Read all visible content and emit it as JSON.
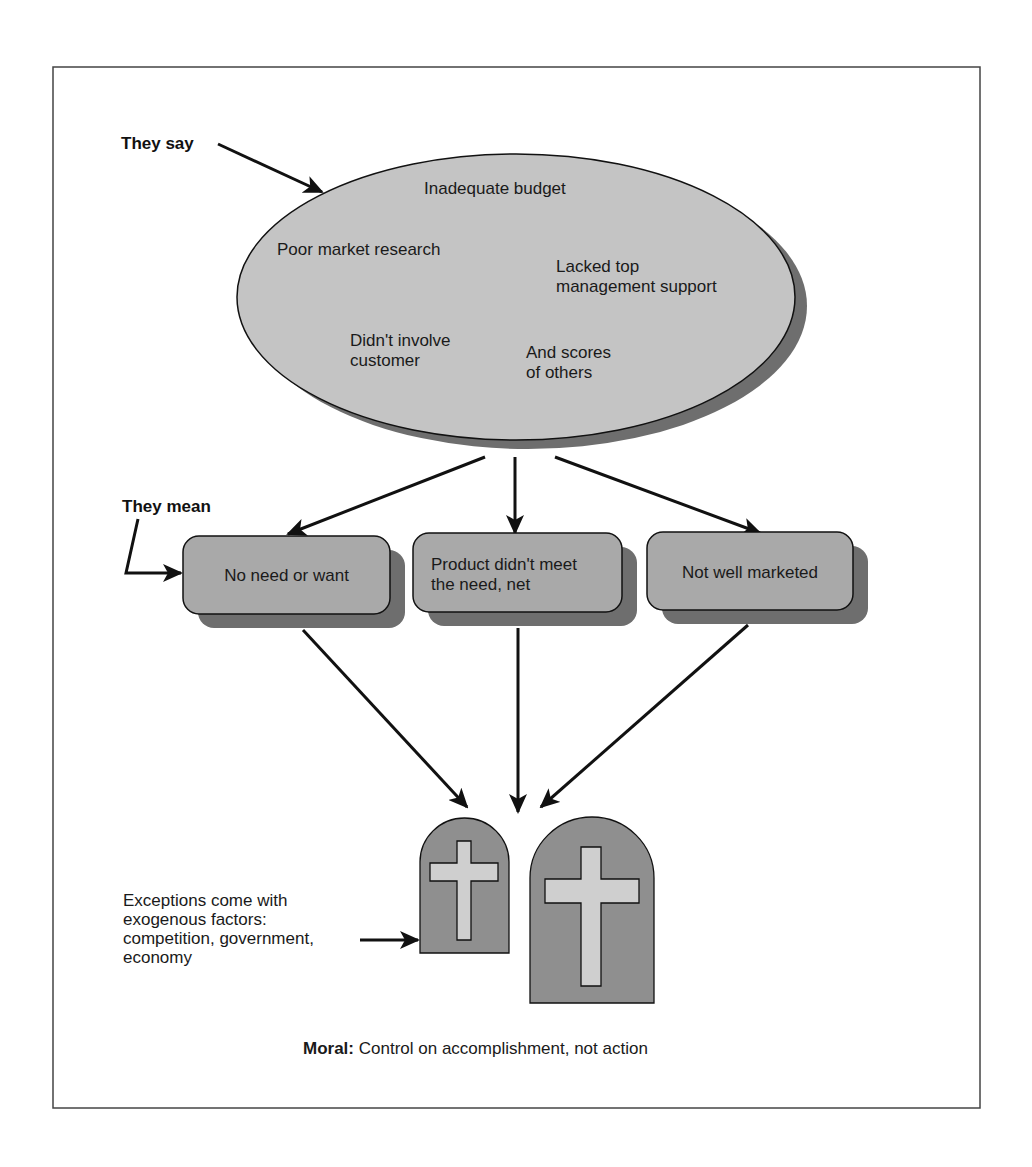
{
  "labels": {
    "they_say": "They say",
    "they_mean": "They mean"
  },
  "ellipse": {
    "reasons": [
      "Inadequate budget",
      "Poor market research",
      "Lacked top",
      "management support",
      "Didn't involve",
      "customer",
      "And scores",
      "of others"
    ]
  },
  "boxes": [
    {
      "lines": [
        "No need or want"
      ]
    },
    {
      "lines": [
        "Product didn't meet",
        "the need, net"
      ]
    },
    {
      "lines": [
        "Not well marketed"
      ]
    }
  ],
  "exceptions": {
    "lines": [
      "Exceptions come with",
      "exogenous factors:",
      "competition, government,",
      "economy"
    ]
  },
  "moral": {
    "label": "Moral:",
    "text": " Control on accomplishment, not action"
  },
  "colors": {
    "shape_fill": "#c4c4c4",
    "box_fill": "#a9a9a9",
    "shadow": "#6e6e6e",
    "tombstone_fill": "#8f8f8f",
    "cross_fill": "#cfcfcf",
    "stroke": "#111111",
    "frame": "#444444"
  }
}
